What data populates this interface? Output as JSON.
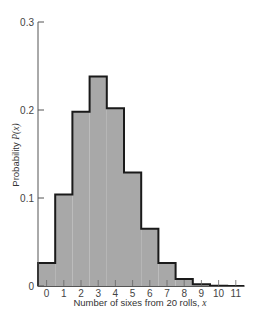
{
  "chart_data": {
    "type": "bar",
    "title": "",
    "xlabel": "Number of sixes from 20 rolls, x",
    "xlabel_main": "Number of sixes from 20 rolls, ",
    "xlabel_var": "x",
    "ylabel": "Probability P(x)",
    "ylabel_main": "Probability ",
    "ylabel_var": "P(x)",
    "categories": [
      "0",
      "1",
      "2",
      "3",
      "4",
      "5",
      "6",
      "7",
      "8",
      "9",
      "10",
      "11"
    ],
    "values": [
      0.026,
      0.104,
      0.198,
      0.238,
      0.202,
      0.129,
      0.065,
      0.026,
      0.008,
      0.002,
      0.0004,
      0.0
    ],
    "ylim": [
      0,
      0.3
    ],
    "yticks": [
      "0",
      "0.1",
      "0.2",
      "0.3"
    ],
    "grid": false,
    "legend": null,
    "style": "step histogram, gray fill with dark outline",
    "colors": {
      "fill": "#a8a8a8",
      "outline": "#1a1a1a",
      "axis": "#555555"
    }
  }
}
